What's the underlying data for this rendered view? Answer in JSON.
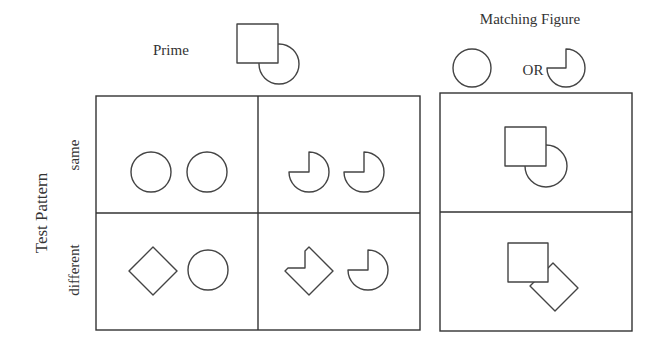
{
  "figure": {
    "prime": {
      "label": "Prime",
      "icon": "square-occluding-circle-icon"
    },
    "matching_figure": {
      "title": "Matching Figure",
      "option_a_icon": "circle-icon",
      "connector": "OR",
      "option_b_icon": "pacman-notched-circle-icon"
    },
    "test_pattern": {
      "axis_label": "Test Pattern",
      "rows": [
        {
          "label": "same",
          "cells": [
            {
              "shapes": [
                "circle",
                "circle"
              ]
            },
            {
              "shapes": [
                "notched-circle",
                "notched-circle"
              ]
            }
          ],
          "matching_example": "square-occluding-circle"
        },
        {
          "label": "different",
          "cells": [
            {
              "shapes": [
                "diamond",
                "circle"
              ]
            },
            {
              "shapes": [
                "notched-diamond",
                "notched-circle"
              ]
            }
          ],
          "matching_example": "square-occluding-rotated-square"
        }
      ]
    },
    "colors": {
      "stroke": "#444444",
      "text": "#333333",
      "background": "#ffffff"
    }
  }
}
